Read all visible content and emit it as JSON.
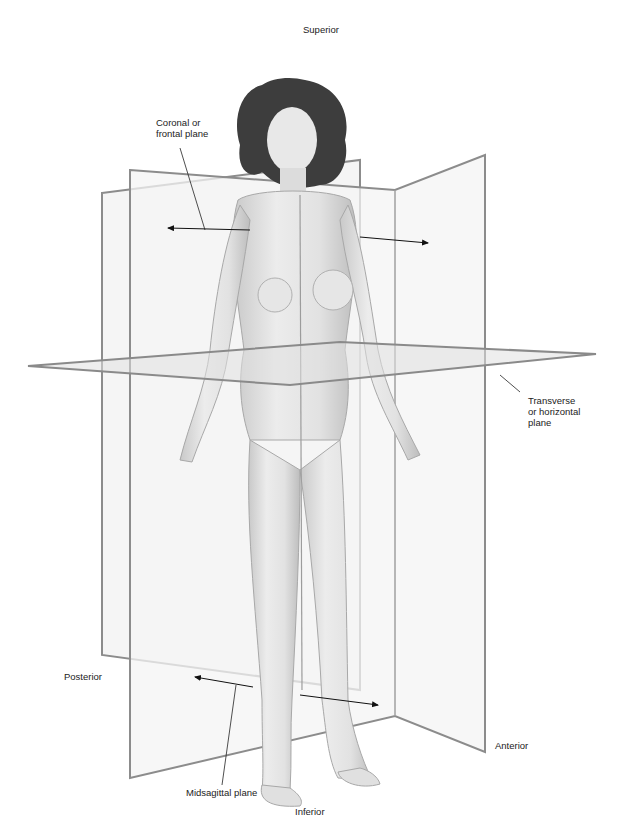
{
  "labels": {
    "superior": "Superior",
    "inferior": "Inferior",
    "anterior": "Anterior",
    "posterior": "Posterior",
    "coronal": "Coronal or\nfrontal plane",
    "transverse": "Transverse\nor horizontal\nplane",
    "midsagittal": "Midsagittal plane"
  },
  "colors": {
    "plane_edge": "#8a8a8a",
    "plane_fill": "#eeeeee",
    "skin_fill": "#e4e4e4",
    "skin_shade": "#bdbdbd",
    "hair": "#3a3a3a",
    "leader": "#222222"
  }
}
